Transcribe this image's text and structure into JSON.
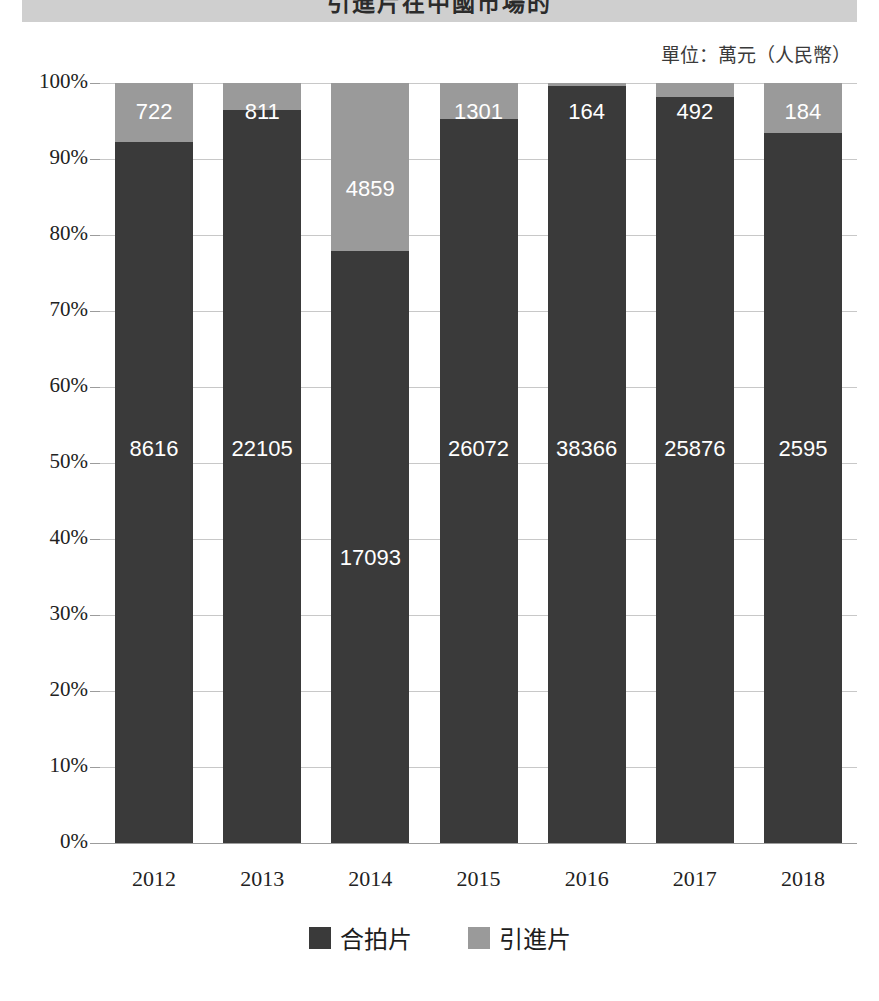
{
  "header": {
    "title": "引進片在中國市場的",
    "unit_caption": "單位：萬元（人民幣）"
  },
  "legend": {
    "position": "bottom-center",
    "items": [
      {
        "label": "合拍片",
        "color": "#3a3a3a",
        "swatch_name": "legend-swatch-co-production"
      },
      {
        "label": "引進片",
        "color": "#9a9a9a",
        "swatch_name": "legend-swatch-imported"
      }
    ]
  },
  "axis": {
    "y_ticks": [
      "100%",
      "90%",
      "80%",
      "70%",
      "60%",
      "50%",
      "40%",
      "30%",
      "20%",
      "10%",
      "0%"
    ],
    "x_ticks": [
      "2012",
      "2013",
      "2014",
      "2015",
      "2016",
      "2017",
      "2018"
    ]
  },
  "chart_data": {
    "type": "bar",
    "stacked": true,
    "normalized": "100%",
    "title": "引進片在中國市場的",
    "subtitle": "單位：萬元（人民幣）",
    "xlabel": "",
    "ylabel": "",
    "ylim": [
      0,
      100
    ],
    "ytick_values": [
      0,
      10,
      20,
      30,
      40,
      50,
      60,
      70,
      80,
      90,
      100
    ],
    "grid": true,
    "legend_position": "bottom",
    "categories": [
      "2012",
      "2013",
      "2014",
      "2015",
      "2016",
      "2017",
      "2018"
    ],
    "series": [
      {
        "name": "合拍片",
        "color": "#3a3a3a",
        "values": [
          8616,
          22105,
          17093,
          26072,
          38366,
          25876,
          2595
        ],
        "percent": [
          92.3,
          96.5,
          77.9,
          95.2,
          99.6,
          98.1,
          93.4
        ]
      },
      {
        "name": "引進片",
        "color": "#9a9a9a",
        "values": [
          722,
          811,
          4859,
          1301,
          164,
          492,
          184
        ],
        "percent": [
          7.7,
          3.5,
          22.1,
          4.8,
          0.4,
          1.9,
          6.6
        ]
      }
    ],
    "data_labels": {
      "合拍片": [
        "8616",
        "22105",
        "17093",
        "26072",
        "38366",
        "25876",
        "2595"
      ],
      "引進片": [
        "722",
        "811",
        "4859",
        "1301",
        "164",
        "492",
        "184"
      ]
    }
  },
  "colors": {
    "dark_series": "#3a3a3a",
    "light_series": "#9a9a9a",
    "gridline": "#c8c8c8",
    "title_band": "#cfcfcf"
  }
}
